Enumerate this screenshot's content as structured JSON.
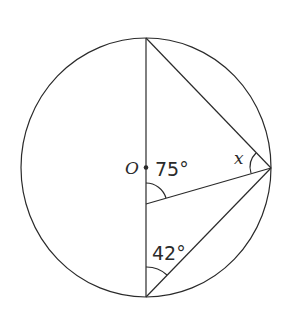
{
  "diagram": {
    "type": "circle-geometry",
    "center_label": "O",
    "labels": {
      "center": "O",
      "angle_center": "75°",
      "angle_bottom": "42°",
      "angle_unknown": "x"
    },
    "angles": [
      {
        "name": "angle_at_interior_point",
        "value": "75°"
      },
      {
        "name": "angle_at_bottom_vertex",
        "value": "42°"
      },
      {
        "name": "angle_at_right_vertex",
        "value": "x"
      }
    ],
    "colors": {
      "stroke": "#2a2a2a",
      "background": "#ffffff"
    }
  }
}
